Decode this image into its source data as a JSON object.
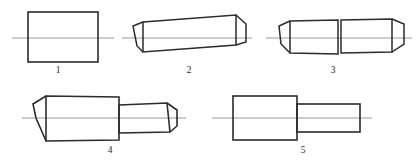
{
  "sheet": {
    "background_color": "#ffffff",
    "line_color": "#2b2b2b",
    "centerline_color": "#9a9a9a",
    "width": 418,
    "height": 162,
    "top_cutoff_text": "— ·  ——  ·—·—  ——·—  — ——"
  },
  "figures": [
    {
      "id": "figure-1",
      "label": "1",
      "description": "plain rectangle with horizontal centerline",
      "label_x": 58,
      "label_y": 66,
      "body": {
        "x": 28,
        "y": 12,
        "width": 70,
        "height": 50
      },
      "centerline": {
        "x1": 12,
        "y1": 38,
        "x2": 114,
        "y2": 38
      },
      "chamfer_left": false,
      "chamfer_right": false
    },
    {
      "id": "figure-2",
      "label": "2",
      "description": "bar with chamfered (beveled) left and right ends",
      "label_x": 189,
      "label_y": 66,
      "body": {
        "x": 135,
        "y": 20,
        "width": 100,
        "height": 30
      },
      "centerline": {
        "x1": 122,
        "y1": 38,
        "x2": 252,
        "y2": 38
      },
      "chamfer_left": true,
      "chamfer_right": true
    },
    {
      "id": "figure-3",
      "label": "3",
      "description": "two equal bars joined end to end, both outer ends chamfered",
      "label_x": 333,
      "label_y": 66,
      "body": {
        "x": 283,
        "y": 20,
        "width": 112,
        "height": 30
      },
      "centerline": {
        "x1": 266,
        "y1": 38,
        "x2": 410,
        "y2": 38
      },
      "chamfer_left": true,
      "chamfer_right": true,
      "split_x": 339
    },
    {
      "id": "figure-4",
      "label": "4",
      "description": "stepped shaft, large diameter left with chamfer, small diameter right with chamfer",
      "label_x": 110,
      "label_y": 146,
      "large": {
        "x": 48,
        "y": 96,
        "width": 72,
        "height": 44
      },
      "small": {
        "x": 120,
        "y": 104,
        "width": 50,
        "height": 28
      },
      "centerline": {
        "x1": 22,
        "y1": 118,
        "x2": 186,
        "y2": 118
      },
      "chamfer_left": true,
      "chamfer_right": true
    },
    {
      "id": "figure-5",
      "label": "5",
      "description": "stepped shaft, both sections square-ended, no chamfers",
      "label_x": 303,
      "label_y": 146,
      "large": {
        "x": 233,
        "y": 96,
        "width": 64,
        "height": 44
      },
      "small": {
        "x": 297,
        "y": 104,
        "width": 63,
        "height": 28
      },
      "centerline": {
        "x1": 212,
        "y1": 118,
        "x2": 372,
        "y2": 118
      },
      "chamfer_left": false,
      "chamfer_right": false
    }
  ]
}
